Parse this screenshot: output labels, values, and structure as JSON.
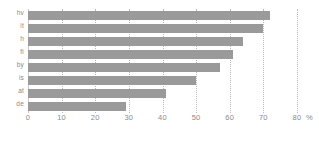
{
  "chart_data": {
    "type": "bar",
    "orientation": "horizontal",
    "title": "",
    "subtitle": "",
    "xlabel": "%",
    "ylabel": "",
    "categories": [
      "hv",
      "it",
      "h",
      "fi",
      "by",
      "is",
      "at",
      "de"
    ],
    "values": [
      72,
      70,
      64,
      61,
      57,
      50,
      41,
      29
    ],
    "series": [
      {
        "name": "",
        "values": [
          72,
          70,
          64,
          61,
          57,
          50,
          41,
          29
        ]
      }
    ],
    "xlim": [
      0,
      80
    ],
    "ylim": [
      0,
      8
    ],
    "xticks": [
      0,
      10,
      20,
      30,
      40,
      50,
      60,
      70,
      80
    ],
    "xtick_labels": [
      "0",
      "10",
      "20",
      "30",
      "40",
      "50",
      "60",
      "70",
      "80"
    ],
    "unit_label": "%",
    "grid": true,
    "grid_axis": "x",
    "grid_style": "dotted",
    "legend": false,
    "legend_position": "none",
    "bar_color": "#9a9a9a",
    "grid_color": "#b9b9b9",
    "axis_color": "#c9c9c9",
    "tick_text_color": "#8a8a8a",
    "background": "#ffffff"
  }
}
